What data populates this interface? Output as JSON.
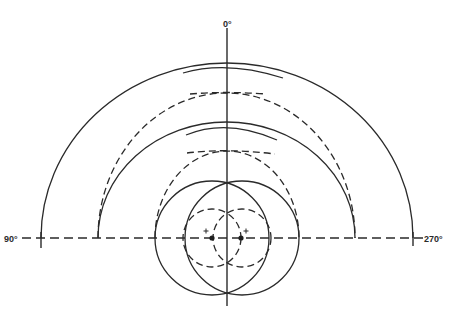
{
  "diagram": {
    "type": "polar-radiation-pattern-construction",
    "labels": {
      "top": "0°",
      "left": "90°",
      "right": "270°"
    },
    "colors": {
      "line": "#2a2a2a",
      "background": "#ffffff"
    },
    "center": {
      "x": 227,
      "y": 238
    },
    "sources": [
      {
        "name": "left-source",
        "x": 212,
        "y": 238,
        "marker": "+"
      },
      {
        "name": "right-source",
        "x": 242,
        "y": 238,
        "marker": "+"
      }
    ],
    "elements": {
      "small_dashed_circles": 2,
      "solid_circles": 2,
      "dashed_arcs": 4,
      "solid_arcs": 4
    }
  }
}
